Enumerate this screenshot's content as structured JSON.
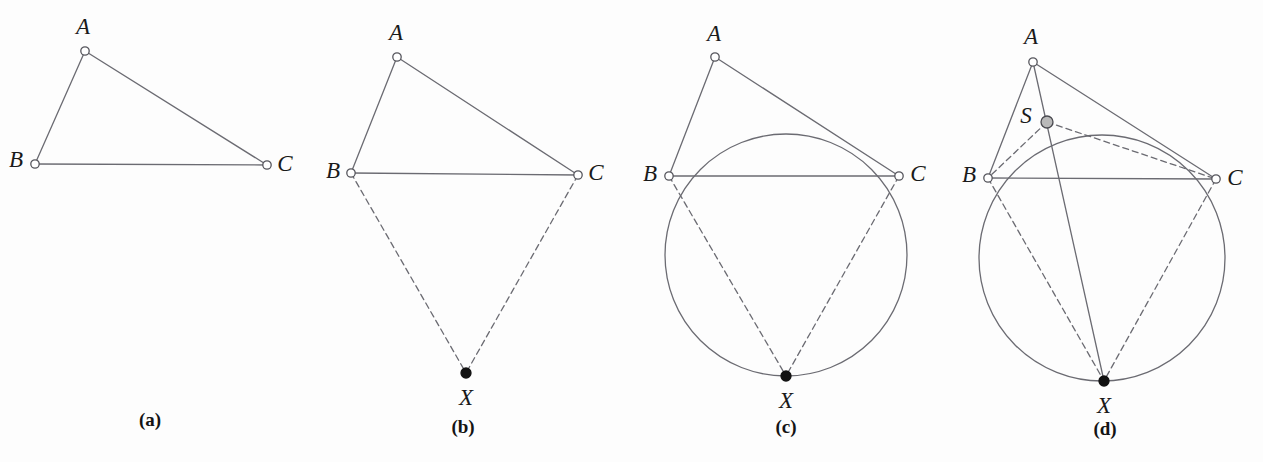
{
  "figure": {
    "width": 1263,
    "height": 462,
    "background": "#fdfdfd",
    "stroke_color": "#6b6b72",
    "stroke_width": 1.3,
    "dash_pattern": "6,4",
    "label_color": "#1a1a1a",
    "open_point": {
      "fill": "#ffffff",
      "stroke": "#55555c",
      "radius": 4.2
    },
    "filled_point": {
      "fill": "#111111",
      "stroke": "#111111",
      "radius": 5.0
    },
    "gray_point": {
      "fill": "#b9b9b9",
      "stroke": "#4a4a50",
      "radius": 6.0
    }
  },
  "panels": [
    {
      "id": "a",
      "caption": "(a)",
      "caption_pos": {
        "x": 150,
        "y": 419
      },
      "points": [
        {
          "name": "A",
          "label": "A",
          "x": 85,
          "y": 51,
          "type": "open",
          "label_x": 83,
          "label_y": 26
        },
        {
          "name": "B",
          "label": "B",
          "x": 35,
          "y": 164,
          "type": "open",
          "label_x": 16,
          "label_y": 159
        },
        {
          "name": "C",
          "label": "C",
          "x": 267,
          "y": 165,
          "type": "open",
          "label_x": 285,
          "label_y": 163
        }
      ],
      "segments": [
        {
          "name": "AB",
          "from": "A",
          "to": "B",
          "style": "solid"
        },
        {
          "name": "AC",
          "from": "A",
          "to": "C",
          "style": "solid"
        },
        {
          "name": "BC",
          "from": "B",
          "to": "C",
          "style": "solid"
        }
      ],
      "circles": []
    },
    {
      "id": "b",
      "caption": "(b)",
      "caption_pos": {
        "x": 463,
        "y": 426
      },
      "points": [
        {
          "name": "A",
          "label": "A",
          "x": 397,
          "y": 57,
          "type": "open",
          "label_x": 396,
          "label_y": 32
        },
        {
          "name": "B",
          "label": "B",
          "x": 351,
          "y": 173,
          "type": "open",
          "label_x": 333,
          "label_y": 170
        },
        {
          "name": "C",
          "label": "C",
          "x": 578,
          "y": 175,
          "type": "open",
          "label_x": 596,
          "label_y": 172
        },
        {
          "name": "X",
          "label": "X",
          "x": 466,
          "y": 373,
          "type": "filled",
          "label_x": 466,
          "label_y": 397
        }
      ],
      "segments": [
        {
          "name": "AB",
          "from": "A",
          "to": "B",
          "style": "solid"
        },
        {
          "name": "AC",
          "from": "A",
          "to": "C",
          "style": "solid"
        },
        {
          "name": "BC",
          "from": "B",
          "to": "C",
          "style": "solid"
        },
        {
          "name": "BX",
          "from": "B",
          "to": "X",
          "style": "dashed"
        },
        {
          "name": "CX",
          "from": "C",
          "to": "X",
          "style": "dashed"
        }
      ],
      "circles": []
    },
    {
      "id": "c",
      "caption": "(c)",
      "caption_pos": {
        "x": 786,
        "y": 426
      },
      "points": [
        {
          "name": "A",
          "label": "A",
          "x": 715,
          "y": 57,
          "type": "open",
          "label_x": 714,
          "label_y": 33
        },
        {
          "name": "B",
          "label": "B",
          "x": 669,
          "y": 176,
          "type": "open",
          "label_x": 650,
          "label_y": 173
        },
        {
          "name": "C",
          "label": "C",
          "x": 899,
          "y": 176,
          "type": "open",
          "label_x": 918,
          "label_y": 173
        },
        {
          "name": "X",
          "label": "X",
          "x": 786,
          "y": 376,
          "type": "filled",
          "label_x": 786,
          "label_y": 400
        }
      ],
      "segments": [
        {
          "name": "AB",
          "from": "A",
          "to": "B",
          "style": "solid"
        },
        {
          "name": "AC",
          "from": "A",
          "to": "C",
          "style": "solid"
        },
        {
          "name": "BC",
          "from": "B",
          "to": "C",
          "style": "solid"
        },
        {
          "name": "BX",
          "from": "B",
          "to": "X",
          "style": "dashed"
        },
        {
          "name": "CX",
          "from": "C",
          "to": "X",
          "style": "dashed"
        }
      ],
      "circles": [
        {
          "name": "circumcircle-BCX",
          "cx": 786,
          "cy": 255,
          "r": 121
        }
      ]
    },
    {
      "id": "d",
      "caption": "(d)",
      "caption_pos": {
        "x": 1105,
        "y": 428
      },
      "points": [
        {
          "name": "A",
          "label": "A",
          "x": 1033,
          "y": 62,
          "type": "open",
          "label_x": 1031,
          "label_y": 36
        },
        {
          "name": "S",
          "label": "S",
          "x": 1047,
          "y": 122,
          "type": "gray",
          "label_x": 1026,
          "label_y": 115
        },
        {
          "name": "B",
          "label": "B",
          "x": 988,
          "y": 178,
          "type": "open",
          "label_x": 969,
          "label_y": 174
        },
        {
          "name": "C",
          "label": "C",
          "x": 1216,
          "y": 179,
          "type": "open",
          "label_x": 1235,
          "label_y": 177
        },
        {
          "name": "X",
          "label": "X",
          "x": 1104,
          "y": 381,
          "type": "filled",
          "label_x": 1104,
          "label_y": 405
        }
      ],
      "segments": [
        {
          "name": "AB",
          "from": "A",
          "to": "B",
          "style": "solid"
        },
        {
          "name": "AC",
          "from": "A",
          "to": "C",
          "style": "solid"
        },
        {
          "name": "BC",
          "from": "B",
          "to": "C",
          "style": "solid"
        },
        {
          "name": "AX",
          "from": "A",
          "to": "X",
          "style": "solid"
        },
        {
          "name": "BX",
          "from": "B",
          "to": "X",
          "style": "dashed"
        },
        {
          "name": "CX",
          "from": "C",
          "to": "X",
          "style": "dashed"
        },
        {
          "name": "SB",
          "from": "S",
          "to": "B",
          "style": "dashed"
        },
        {
          "name": "SC",
          "from": "S",
          "to": "C",
          "style": "dashed"
        }
      ],
      "circles": [
        {
          "name": "circumcircle-BCX",
          "cx": 1102,
          "cy": 258,
          "r": 123
        }
      ]
    }
  ]
}
